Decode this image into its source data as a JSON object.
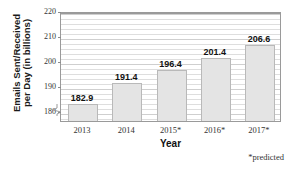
{
  "chart_data": {
    "type": "bar",
    "title": "",
    "xlabel": "Year",
    "ylabel": "Emails Sent/Received per Day (in billions)",
    "ylabel_line1": "Emails Sent/Received",
    "ylabel_line2": "per Day (in billions)",
    "categories": [
      "2013",
      "2014",
      "2015*",
      "2016*",
      "2017*"
    ],
    "values": [
      182.9,
      191.4,
      196.4,
      201.4,
      206.6
    ],
    "value_labels": [
      "182.9",
      "191.4",
      "196.4",
      "201.4",
      "206.6"
    ],
    "ylim": [
      176,
      220
    ],
    "y_ticks": [
      220,
      210,
      200,
      190,
      180
    ],
    "y_tick_labels": [
      "220",
      "210",
      "200",
      "190",
      "180"
    ],
    "y_minor_step": 2,
    "grid": true,
    "legend": "none",
    "axis_break": true,
    "footnote": "*predicted",
    "bar_color": "#e4e4e4",
    "bar_border_color": "#b9b9b9",
    "grid_color": "#dedede",
    "axis_color": "#9a9a9a"
  }
}
